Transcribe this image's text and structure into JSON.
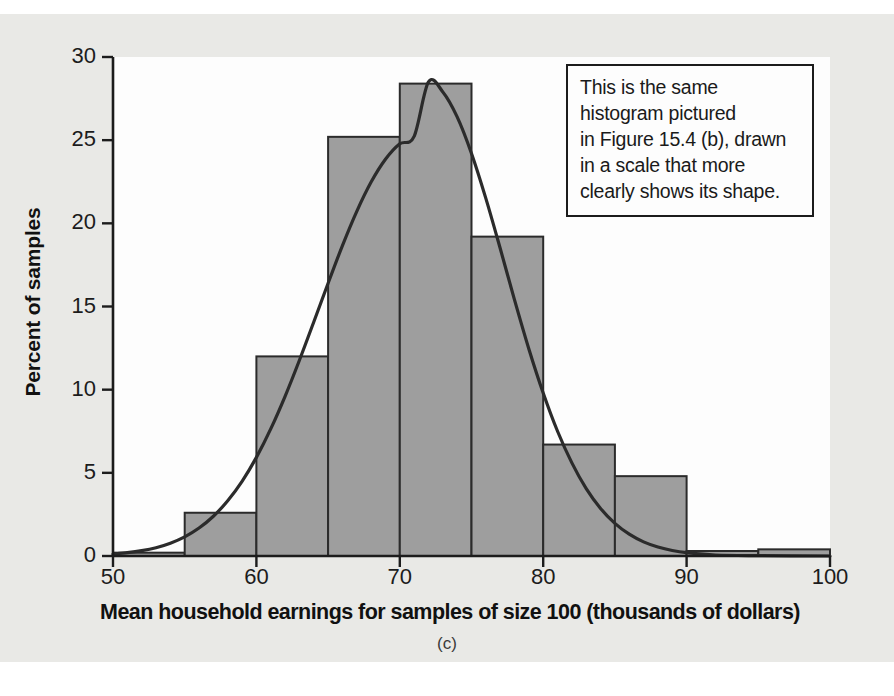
{
  "figure": {
    "caption": "(c)",
    "bar_fill_color": "#9e9e9e",
    "bar_stroke_color": "#2b2b2b",
    "curve_color": "#2b2b2b",
    "paper_color": "#e9e9e6",
    "plot_bg_color": "#fdfdfd",
    "axis_color": "#1c1c1c"
  },
  "annotation": {
    "lines": [
      "This is the same",
      "histogram pictured",
      "in Figure 15.4 (b), drawn",
      "in a scale that more",
      "clearly shows its shape."
    ]
  },
  "chart_data": {
    "type": "bar",
    "title": "",
    "subtitle": "",
    "xlabel": "Mean household earnings for samples of size 100 (thousands of dollars)",
    "ylabel": "Percent of samples",
    "xlim": [
      50,
      100
    ],
    "ylim": [
      0,
      30
    ],
    "xticks": [
      50,
      60,
      70,
      80,
      90,
      100
    ],
    "yticks": [
      0,
      5,
      10,
      15,
      20,
      25,
      30
    ],
    "xtick_labels": [
      "50",
      "60",
      "70",
      "80",
      "90",
      "100"
    ],
    "ytick_labels": [
      "0",
      "5",
      "10",
      "15",
      "20",
      "25",
      "30"
    ],
    "grid": false,
    "legend": "none",
    "bin_width": 5,
    "bin_edges": [
      50,
      55,
      60,
      65,
      70,
      75,
      80,
      85,
      90,
      95,
      100
    ],
    "categories": [
      "50-55",
      "55-60",
      "60-65",
      "65-70",
      "70-75",
      "75-80",
      "80-85",
      "85-90",
      "90-95",
      "95-100"
    ],
    "values": [
      0.2,
      2.6,
      12.0,
      25.2,
      28.4,
      19.2,
      6.7,
      4.8,
      0.3,
      0.4
    ],
    "overlay": {
      "type": "line",
      "name": "normal density curve",
      "mean": 72.0,
      "sd": 6.6,
      "peak_value": 28.5,
      "points": [
        [
          50.0,
          0.12
        ],
        [
          51.0,
          0.2
        ],
        [
          52.0,
          0.32
        ],
        [
          53.0,
          0.5
        ],
        [
          54.0,
          0.77
        ],
        [
          55.0,
          1.15
        ],
        [
          56.0,
          1.68
        ],
        [
          57.0,
          2.39
        ],
        [
          58.0,
          3.32
        ],
        [
          59.0,
          4.49
        ],
        [
          60.0,
          5.93
        ],
        [
          61.0,
          7.64
        ],
        [
          62.0,
          9.6
        ],
        [
          63.0,
          11.77
        ],
        [
          64.0,
          14.07
        ],
        [
          65.0,
          16.4
        ],
        [
          66.0,
          18.66
        ],
        [
          67.0,
          20.72
        ],
        [
          68.0,
          22.48
        ],
        [
          69.0,
          23.85
        ],
        [
          70.0,
          24.78
        ],
        [
          71.0,
          25.23
        ],
        [
          72.0,
          28.5
        ],
        [
          73.0,
          27.9
        ],
        [
          74.0,
          26.4
        ],
        [
          75.0,
          24.2
        ],
        [
          76.0,
          21.5
        ],
        [
          77.0,
          18.5
        ],
        [
          78.0,
          15.4
        ],
        [
          79.0,
          12.45
        ],
        [
          80.0,
          9.8
        ],
        [
          81.0,
          7.5
        ],
        [
          82.0,
          5.6
        ],
        [
          83.0,
          4.05
        ],
        [
          84.0,
          2.86
        ],
        [
          85.0,
          1.96
        ],
        [
          86.0,
          1.31
        ],
        [
          87.0,
          0.85
        ],
        [
          88.0,
          0.54
        ],
        [
          89.0,
          0.33
        ],
        [
          90.0,
          0.2
        ],
        [
          92.0,
          0.06
        ],
        [
          95.0,
          0.02
        ],
        [
          100.0,
          0.0
        ]
      ]
    }
  }
}
